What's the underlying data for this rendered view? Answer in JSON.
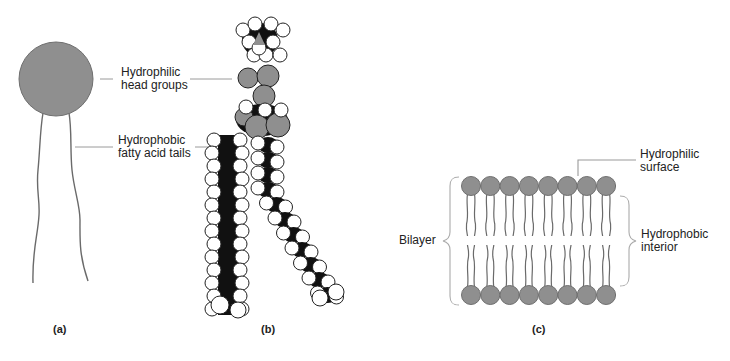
{
  "figure": {
    "panels": [
      {
        "id": "a",
        "label": "(a)",
        "description": "Simplified phospholipid: circular head with two wavy tails"
      },
      {
        "id": "b",
        "label": "(b)",
        "description": "Space-filling model of a phospholipid"
      },
      {
        "id": "c",
        "label": "(c)",
        "description": "Phospholipid bilayer"
      }
    ],
    "labels": {
      "head_line1": "Hydrophilic",
      "head_line2": "head groups",
      "tail_line1": "Hydrophobic",
      "tail_line2": "fatty acid tails",
      "surface_line1": "Hydrophilic",
      "surface_line2": "surface",
      "bilayer": "Bilayer",
      "interior_line1": "Hydrophobic",
      "interior_line2": "interior"
    },
    "bilayer": {
      "heads_per_layer": 8,
      "layers": 2
    },
    "colors": {
      "head_fill": "#8f8f8f",
      "head_stroke": "#6f6f6f",
      "tail_stroke": "#6a6a6a",
      "leader_line": "#9a9a9a",
      "atom_dark": "#111111",
      "atom_white": "#ffffff"
    }
  }
}
